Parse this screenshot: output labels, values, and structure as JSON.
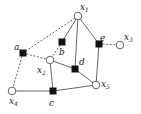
{
  "diagram": {
    "type": "factor-graph",
    "variable_nodes": [
      {
        "id": "x1",
        "label": "x",
        "sub": "1",
        "x": 78,
        "y": 16,
        "lx": 80,
        "ly": 10
      },
      {
        "id": "x2",
        "label": "x",
        "sub": "2",
        "x": 50,
        "y": 60,
        "lx": 37,
        "ly": 73
      },
      {
        "id": "x3",
        "label": "x",
        "sub": "3",
        "x": 120,
        "y": 45,
        "lx": 124,
        "ly": 40
      },
      {
        "id": "x4",
        "label": "x",
        "sub": "4",
        "x": 12,
        "y": 91,
        "lx": 9,
        "ly": 104
      },
      {
        "id": "x5",
        "label": "x",
        "sub": "5",
        "x": 96,
        "y": 85,
        "lx": 101,
        "ly": 87
      }
    ],
    "factor_nodes": [
      {
        "id": "a",
        "label": "a",
        "x": 23,
        "y": 53,
        "lx": 14,
        "ly": 50
      },
      {
        "id": "b",
        "label": "b",
        "x": 62,
        "y": 42,
        "lx": 59,
        "ly": 55
      },
      {
        "id": "c",
        "label": "c",
        "x": 53,
        "y": 91,
        "lx": 49,
        "ly": 106
      },
      {
        "id": "d",
        "label": "d",
        "x": 75,
        "y": 69,
        "lx": 79,
        "ly": 65
      },
      {
        "id": "e",
        "label": "e",
        "x": 99,
        "y": 44,
        "lx": 100,
        "ly": 41
      }
    ],
    "edges": [
      {
        "from": "x1",
        "to": "b",
        "style": "solid"
      },
      {
        "from": "x1",
        "to": "d",
        "style": "solid"
      },
      {
        "from": "x1",
        "to": "e",
        "style": "solid"
      },
      {
        "from": "x1",
        "to": "a",
        "style": "dashed"
      },
      {
        "from": "b",
        "to": "x2",
        "style": "dashed"
      },
      {
        "from": "a",
        "to": "x2",
        "style": "dashed"
      },
      {
        "from": "a",
        "to": "x4",
        "style": "dashed"
      },
      {
        "from": "x2",
        "to": "d",
        "style": "solid"
      },
      {
        "from": "x2",
        "to": "c",
        "style": "solid"
      },
      {
        "from": "d",
        "to": "x5",
        "style": "solid"
      },
      {
        "from": "e",
        "to": "x5",
        "style": "solid"
      },
      {
        "from": "e",
        "to": "x3",
        "style": "dashed"
      },
      {
        "from": "x4",
        "to": "c",
        "style": "solid"
      },
      {
        "from": "c",
        "to": "x5",
        "style": "solid"
      }
    ],
    "colors": {
      "line": "#555555",
      "factor": "#111111",
      "variable_fill": "#ffffff",
      "variable_stroke": "#555555"
    }
  }
}
